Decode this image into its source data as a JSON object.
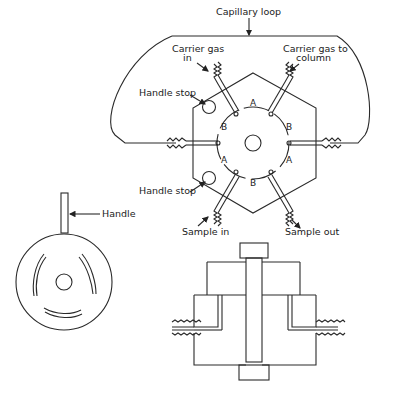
{
  "figure": {
    "labels": {
      "capillary_loop": "Capillary loop",
      "carrier_in_line1": "Carrier gas",
      "carrier_in_line2": "in",
      "carrier_out_line1": "Carrier gas to",
      "carrier_out_line2": "column",
      "handle_stop_top": "Handle stop",
      "handle_stop_bottom": "Handle stop",
      "sample_in": "Sample in",
      "sample_out": "Sample out",
      "handle": "Handle"
    },
    "flow_paths": {
      "top": "A",
      "upper_left": "B",
      "upper_right": "B",
      "lower_left": "A",
      "lower_right": "A",
      "bottom": "B"
    },
    "views": [
      "top view of valve body",
      "rotor disc with handle",
      "cross-section of valve"
    ]
  }
}
